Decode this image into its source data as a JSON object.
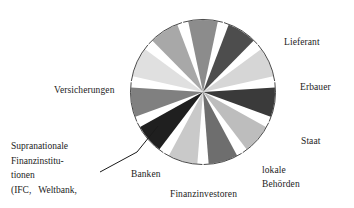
{
  "figure": {
    "title": "",
    "background": "#ffffff"
  },
  "labels": {
    "lieferant": "Lieferant",
    "erbauer": "Erbauer",
    "staat": "Staat",
    "lokale": "lokale",
    "behoerden": "Behörden",
    "finanzinvestoren": "Finanzinvestoren",
    "banken": "Banken",
    "versicherungen": "Versicherungen",
    "supranationale_line1": "Supranationale",
    "supranationale_line2": "Finanzinstitu-",
    "supranationale_line3": "tionen",
    "supranationale_line4": "(IFC,   Weltbank,"
  },
  "chart_data": {
    "type": "pie",
    "title": "",
    "xlabel": "",
    "ylabel": "",
    "legend_position": "around-slices",
    "grid": false,
    "exploded": true,
    "slice_count": 11,
    "categories": [
      "Lieferant",
      "Erbauer",
      "Staat",
      "lokale Behörden",
      "Finanzinvestoren",
      "Banken",
      "Supranationale Finanzinstitutionen (IFC, Weltbank,",
      "Versicherungen",
      "Segment 9",
      "Segment 10",
      "Segment 11"
    ],
    "values": [
      9.09,
      9.09,
      9.09,
      9.09,
      9.09,
      9.09,
      9.09,
      9.09,
      9.09,
      9.09,
      9.09
    ],
    "colors": [
      "#8c8c8c",
      "#4d4d4d",
      "#d6d6d6",
      "#3a3a3a",
      "#bdbdbd",
      "#6e6e6e",
      "#c9c9c9",
      "#1f1f1f",
      "#808080",
      "#e0e0e0",
      "#a8a8a8"
    ],
    "geometry": {
      "center_x": 203,
      "center_y": 92,
      "radius": 72,
      "gap_degrees": 9,
      "outline_color": "#1a1a1a"
    }
  },
  "leader_line": {
    "from_x": 100,
    "from_y": 172,
    "mid_x": 137,
    "mid_y": 152,
    "to_x": 158,
    "to_y": 126,
    "color": "#1a1a1a"
  }
}
